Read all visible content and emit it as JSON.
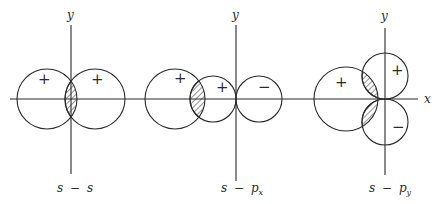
{
  "figure": {
    "colors": {
      "ink": "#2a2a2a",
      "background": "#ffffff"
    },
    "x_axis": {
      "label": "x"
    },
    "panels": [
      {
        "id": "s-s",
        "caption": {
          "left": "s",
          "op": "−",
          "right": "s",
          "sub": ""
        },
        "y_axis_label": "y",
        "lobes": [
          {
            "sign": "+",
            "role": "s orbital (left)"
          },
          {
            "sign": "+",
            "role": "s orbital (right)"
          }
        ],
        "overlap": "positive (hatched)"
      },
      {
        "id": "s-px",
        "caption": {
          "left": "s",
          "op": "−",
          "right": "p",
          "sub": "x"
        },
        "y_axis_label": "y",
        "lobes": [
          {
            "sign": "+",
            "role": "s orbital"
          },
          {
            "sign": "+",
            "role": "px positive lobe"
          },
          {
            "sign": "−",
            "role": "px negative lobe"
          }
        ],
        "overlap": "positive (hatched)"
      },
      {
        "id": "s-py",
        "caption": {
          "left": "s",
          "op": "−",
          "right": "p",
          "sub": "y"
        },
        "y_axis_label": "y",
        "lobes": [
          {
            "sign": "+",
            "role": "s orbital"
          },
          {
            "sign": "+",
            "role": "py positive lobe"
          },
          {
            "sign": "−",
            "role": "py negative lobe"
          }
        ],
        "overlap": "zero net (positive and negative hatched regions cancel)"
      }
    ]
  }
}
